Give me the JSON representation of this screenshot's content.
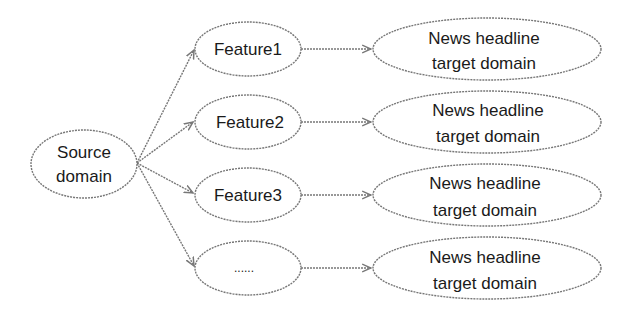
{
  "diagram": {
    "type": "flow",
    "source": {
      "line1": "Source",
      "line2": "domain"
    },
    "features": [
      {
        "label": "Feature1"
      },
      {
        "label": "Feature2"
      },
      {
        "label": "Feature3"
      },
      {
        "label": "......"
      }
    ],
    "targets": [
      {
        "line1": "News headline",
        "line2": "target domain"
      },
      {
        "line1": "News headline",
        "line2": "target domain"
      },
      {
        "line1": "News headline",
        "line2": "target domain"
      },
      {
        "line1": "News headline",
        "line2": "target domain"
      }
    ],
    "colors": {
      "stroke": "#777777",
      "text": "#1a1a1a",
      "background": "#ffffff"
    }
  }
}
